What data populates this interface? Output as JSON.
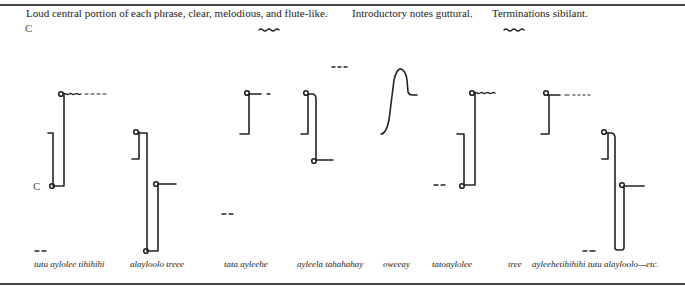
{
  "header": {
    "caption_1": "Loud central portion of each phrase, clear, melodious, and flute-like.",
    "caption_2": "Introductory notes guttural.",
    "caption_3": "Terminations sibilant."
  },
  "pitch_labels": {
    "upper": "C",
    "lower": "C"
  },
  "phrases": [
    {
      "label": "tutu aylolee tihihihi"
    },
    {
      "label": "alayloolo treee"
    },
    {
      "label": "tata ayleehe"
    },
    {
      "label": "ayleela tahahahay"
    },
    {
      "label": "oweeay"
    },
    {
      "label": "tatoaylolee"
    },
    {
      "label": "tree"
    },
    {
      "label": "ayleehetihihihi tutu alayloolo—etc."
    }
  ],
  "legend_marks": {
    "clear_melodious": "wavy-underline",
    "sibilant": "wavy-underline"
  },
  "colors": {
    "ink": "#222222",
    "rule": "#444444"
  }
}
